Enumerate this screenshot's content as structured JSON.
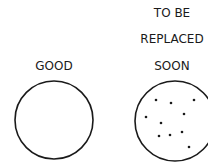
{
  "diagram": {
    "left": {
      "label": "GOOD",
      "circle": {
        "cx": 54,
        "cy": 120,
        "r": 39
      }
    },
    "right": {
      "label_lines": [
        "TO BE",
        "REPLACED",
        "SOON"
      ],
      "circle": {
        "cx": 175,
        "cy": 121,
        "r": 40
      },
      "spots": [
        [
          156,
          100
        ],
        [
          171,
          103
        ],
        [
          194,
          100
        ],
        [
          146,
          117
        ],
        [
          184,
          114
        ],
        [
          161,
          123
        ],
        [
          159,
          136
        ],
        [
          170,
          135
        ],
        [
          182,
          132
        ],
        [
          189,
          147
        ]
      ]
    },
    "colors": {
      "stroke": "#1a1a1a",
      "background": "#ffffff"
    }
  }
}
